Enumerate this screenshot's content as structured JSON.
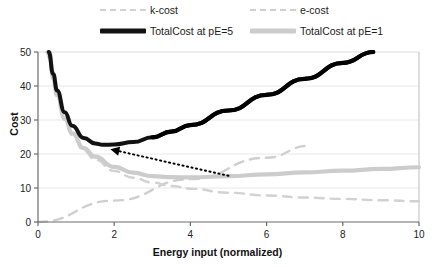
{
  "chart_data": {
    "type": "line",
    "title": "",
    "xlabel": "Energy input (normalized)",
    "ylabel": "Cost",
    "xlim": [
      0,
      10
    ],
    "ylim": [
      0,
      50
    ],
    "xticks": [
      0,
      2,
      4,
      6,
      8,
      10
    ],
    "yticks": [
      0,
      10,
      20,
      30,
      40,
      50
    ],
    "grid": "horizontal",
    "legend_position": "top",
    "series": [
      {
        "name": "k-cost",
        "style": "dashed",
        "color": "#d2d2d2",
        "note": "decreasing hyperbolic knowledge cost",
        "x": [
          0.22,
          0.3,
          0.4,
          0.5,
          0.7,
          0.9,
          1.2,
          1.5,
          2.0,
          2.5,
          3.0,
          3.5,
          4.0,
          5.0,
          6.0,
          7.0,
          8.0,
          9.0,
          10.0
        ],
        "y": [
          50.0,
          48.0,
          42.0,
          37.0,
          30.0,
          25.5,
          21.0,
          18.3,
          15.0,
          13.0,
          11.6,
          10.6,
          9.8,
          8.6,
          7.8,
          7.2,
          6.8,
          6.4,
          6.1
        ]
      },
      {
        "name": "e-cost",
        "style": "dashed",
        "color": "#cfcfcf",
        "note": "linear energy cost through origin",
        "x": [
          0.0,
          2.0,
          4.0,
          6.0,
          7.1
        ],
        "y": [
          0.0,
          6.3,
          12.6,
          18.9,
          22.4
        ]
      },
      {
        "name": "TotalCost at pE=5",
        "style": "solid",
        "color": "#121212",
        "note": "k-cost plus high energy price; minimum near x=1.7",
        "x": [
          0.28,
          0.4,
          0.5,
          0.7,
          0.9,
          1.2,
          1.5,
          1.7,
          2.0,
          2.5,
          3.0,
          3.5,
          4.0,
          5.0,
          6.0,
          7.0,
          8.0,
          8.8
        ],
        "y": [
          50.0,
          43.5,
          38.7,
          32.3,
          28.3,
          24.7,
          23.1,
          22.7,
          22.8,
          23.5,
          24.9,
          26.6,
          28.5,
          32.8,
          37.4,
          42.1,
          46.8,
          50.0
        ]
      },
      {
        "name": "TotalCost at pE=1",
        "style": "solid",
        "color": "#cccccc",
        "note": "k-cost plus low energy price; shallow minimum near x=5",
        "x": [
          0.3,
          0.4,
          0.5,
          0.7,
          0.9,
          1.2,
          1.5,
          2.0,
          2.5,
          3.0,
          3.5,
          4.0,
          5.0,
          6.0,
          7.0,
          8.0,
          9.0,
          10.0
        ],
        "y": [
          50.0,
          42.2,
          37.3,
          30.4,
          26.1,
          21.7,
          19.2,
          16.2,
          14.5,
          13.5,
          13.2,
          13.1,
          13.5,
          14.0,
          14.6,
          15.1,
          15.6,
          16.1
        ]
      }
    ],
    "annotations": [
      {
        "type": "arrow",
        "style": "dotted",
        "color": "#000000",
        "from_x": 5.0,
        "from_y": 13.6,
        "to_x": 1.9,
        "to_y": 21.4,
        "head": "left"
      }
    ]
  },
  "legend": {
    "items": [
      {
        "label": "k-cost",
        "swatch": "dashed-light-gray"
      },
      {
        "label": "e-cost",
        "swatch": "dashed-light-gray"
      },
      {
        "label": "TotalCost at pE=5",
        "swatch": "solid-black"
      },
      {
        "label": "TotalCost at pE=1",
        "swatch": "solid-gray"
      }
    ]
  },
  "axes": {
    "y_title": "Cost",
    "x_title": "Energy input (normalized)",
    "y_tick_labels": [
      "0",
      "10",
      "20",
      "30",
      "40",
      "50"
    ],
    "x_tick_labels": [
      "0",
      "2",
      "4",
      "6",
      "8",
      "10"
    ]
  },
  "colors": {
    "kcost": "#d2d2d2",
    "ecost": "#cfcfcf",
    "total_pe5": "#121212",
    "total_pe1": "#cccccc",
    "grid": "#e8e8e8",
    "axis": "#6b6b6b",
    "text": "#111111"
  }
}
